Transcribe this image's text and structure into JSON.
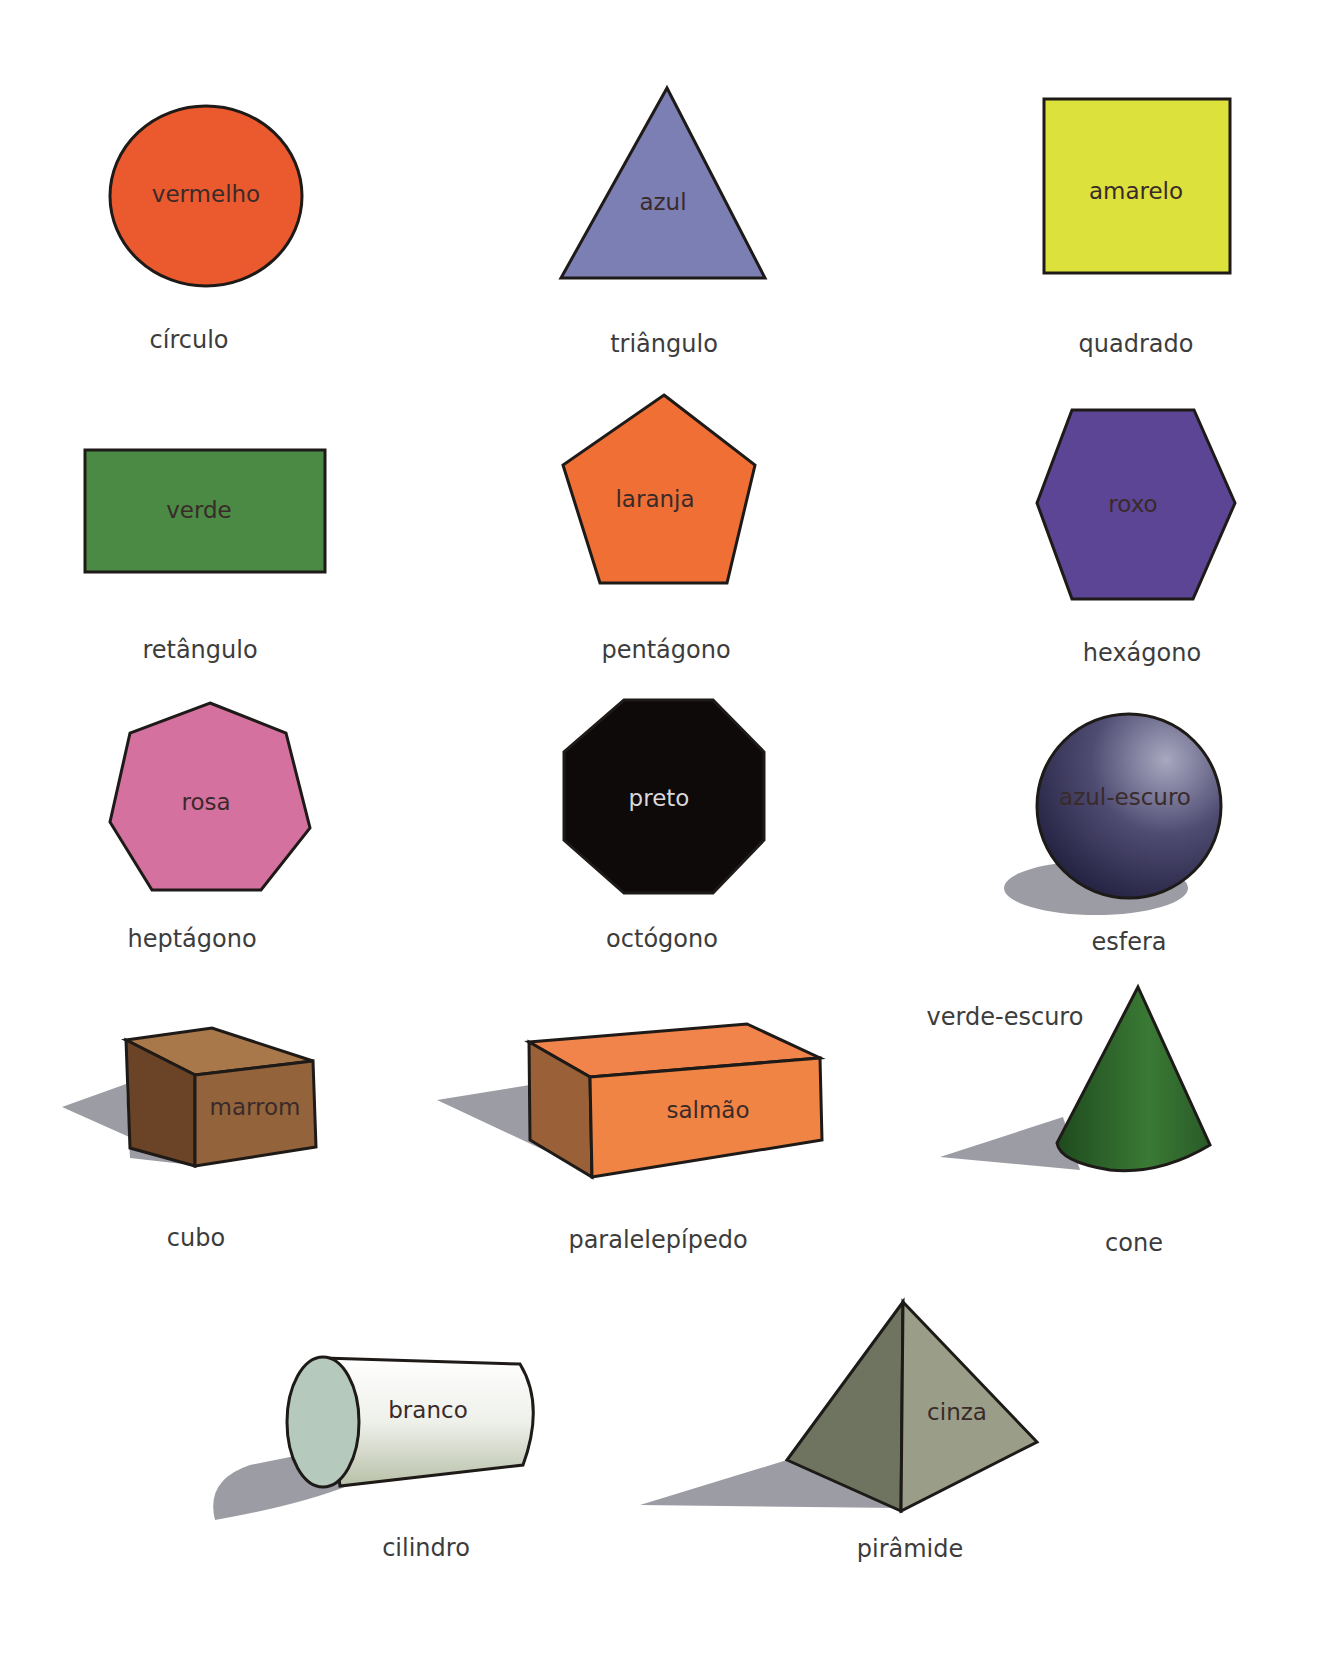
{
  "colors": {
    "background": "#ffffff",
    "outline": "#1e1a18",
    "caption_text": "#3c3c3c",
    "shadow": "#9c9ca4"
  },
  "shapes": [
    {
      "id": "circle",
      "name": "círculo",
      "color_label": "vermelho",
      "fill": "#ea5a2e"
    },
    {
      "id": "triangle",
      "name": "triângulo",
      "color_label": "azul",
      "fill": "#7c7fb3"
    },
    {
      "id": "square",
      "name": "quadrado",
      "color_label": "amarelo",
      "fill": "#dce13c"
    },
    {
      "id": "rectangle",
      "name": "retângulo",
      "color_label": "verde",
      "fill": "#4a8a45"
    },
    {
      "id": "pentagon",
      "name": "pentágono",
      "color_label": "laranja",
      "fill": "#ef6f35"
    },
    {
      "id": "hexagon",
      "name": "hexágono",
      "color_label": "roxo",
      "fill": "#5b4594"
    },
    {
      "id": "heptagon",
      "name": "heptágono",
      "color_label": "rosa",
      "fill": "#d5719f"
    },
    {
      "id": "octagon",
      "name": "octógono",
      "color_label": "preto",
      "fill": "#0e0a0a"
    },
    {
      "id": "sphere",
      "name": "esfera",
      "color_label": "azul-escuro",
      "fill": "#2c2a4e"
    },
    {
      "id": "cube",
      "name": "cubo",
      "color_label": "marrom",
      "fill": "#93643c"
    },
    {
      "id": "cuboid",
      "name": "paralelepípedo",
      "color_label": "salmão",
      "fill": "#ef8445"
    },
    {
      "id": "cone",
      "name": "cone",
      "color_label": "verde-escuro",
      "fill": "#2f6a2c"
    },
    {
      "id": "cylinder",
      "name": "cilindro",
      "color_label": "branco",
      "fill": "#e8ece4"
    },
    {
      "id": "pyramid",
      "name": "pirâmide",
      "color_label": "cinza",
      "fill": "#8d917c"
    }
  ]
}
